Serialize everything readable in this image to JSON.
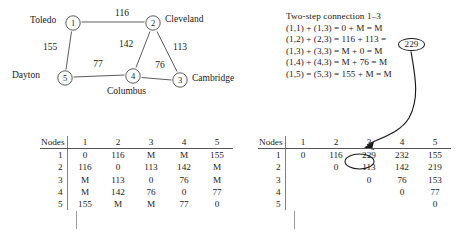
{
  "graph": {
    "nodes": [
      {
        "id": "1",
        "label": "Toledo",
        "x": 73,
        "y": 23,
        "label_x": 30,
        "label_y": 16
      },
      {
        "id": "2",
        "label": "Cleveland",
        "x": 153,
        "y": 23,
        "label_x": 165,
        "label_y": 15
      },
      {
        "id": "3",
        "label": "Cambridge",
        "x": 180,
        "y": 80,
        "label_x": 192,
        "label_y": 74
      },
      {
        "id": "4",
        "label": "Columbus",
        "x": 133,
        "y": 76,
        "label_x": 107,
        "label_y": 87
      },
      {
        "id": "5",
        "label": "Dayton",
        "x": 65,
        "y": 78,
        "label_x": 12,
        "label_y": 71
      }
    ],
    "edges": [
      {
        "from": "1",
        "to": "2",
        "weight": "116",
        "wx": 122,
        "wy": 14
      },
      {
        "from": "1",
        "to": "5",
        "weight": "155",
        "wx": 50,
        "wy": 48
      },
      {
        "from": "2",
        "to": "4",
        "weight": "142",
        "wx": 126,
        "wy": 45
      },
      {
        "from": "2",
        "to": "3",
        "weight": "113",
        "wx": 180,
        "wy": 48
      },
      {
        "from": "4",
        "to": "3",
        "weight": "76",
        "wx": 160,
        "wy": 66
      },
      {
        "from": "5",
        "to": "4",
        "weight": "77",
        "wx": 98,
        "wy": 65
      }
    ]
  },
  "equations": {
    "title": "Two-step connection 1–3",
    "lines": [
      "(1,1) + (1,3) = 0 + M = M",
      "(1,2) + (2,3) = 116 + 113 = ",
      "(1,3) + (3,3) = M + 0 = M",
      "(1,4) + (4,3) = M + 76 = M",
      "(1,5) = (5,3) = 155 + M = M"
    ],
    "highlight_value": "229"
  },
  "matrix_left": {
    "corner_label": "Nodes",
    "columns": [
      "1",
      "2",
      "3",
      "4",
      "5"
    ],
    "rows": [
      {
        "label": "1",
        "cells": [
          "0",
          "116",
          "M",
          "M",
          "155"
        ]
      },
      {
        "label": "2",
        "cells": [
          "116",
          "0",
          "113",
          "142",
          "M"
        ]
      },
      {
        "label": "3",
        "cells": [
          "M",
          "113",
          "0",
          "76",
          "M"
        ]
      },
      {
        "label": "4",
        "cells": [
          "M",
          "142",
          "76",
          "0",
          "77"
        ]
      },
      {
        "label": "5",
        "cells": [
          "155",
          "M",
          "M",
          "77",
          "0"
        ]
      }
    ]
  },
  "matrix_right": {
    "corner_label": "Nodes",
    "columns": [
      "1",
      "2",
      "3",
      "4",
      "5"
    ],
    "rows": [
      {
        "label": "1",
        "cells": [
          "0",
          "116",
          "229",
          "232",
          "155"
        ]
      },
      {
        "label": "2",
        "cells": [
          "",
          "0",
          "113",
          "142",
          "219"
        ]
      },
      {
        "label": "3",
        "cells": [
          "",
          "",
          "0",
          "76",
          "153"
        ]
      },
      {
        "label": "4",
        "cells": [
          "",
          "",
          "",
          "0",
          "77"
        ]
      },
      {
        "label": "5",
        "cells": [
          "",
          "",
          "",
          "",
          "0"
        ]
      }
    ],
    "highlighted_cell": {
      "row": "1",
      "column": "3",
      "value": "229"
    }
  },
  "colors": {
    "ink": "#1a1a1a",
    "rule": "#555555",
    "graph_stroke": "#4a4a4a",
    "background": "#ffffff"
  }
}
